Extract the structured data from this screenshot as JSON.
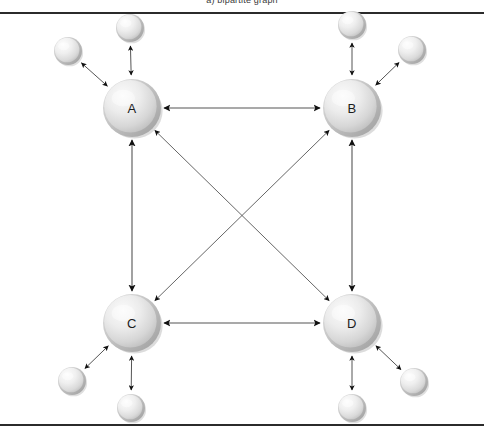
{
  "figure": {
    "width": 484,
    "height": 445,
    "background": "#ffffff",
    "caption_clipped": "a) bipartite graph",
    "frame": {
      "top_rule_y": 12,
      "bottom_rule_y": 424,
      "rule_color": "#2b2b2b",
      "rule_thickness": 2
    }
  },
  "style": {
    "node_fill_light": "#f2f2f2",
    "node_fill_mid": "#d9d9d9",
    "node_fill_dark": "#b4b4b4",
    "node_rim": "#a8a8a8",
    "node_shadow": "#bfbfbf",
    "arrow_color": "#1a1a1a",
    "line_color": "#555555",
    "label_color": "#1c1c1c"
  },
  "main_nodes": [
    {
      "id": "A",
      "label": "A",
      "cx": 132,
      "cy": 108,
      "r": 29
    },
    {
      "id": "B",
      "label": "B",
      "cx": 352,
      "cy": 108,
      "r": 29
    },
    {
      "id": "C",
      "label": "C",
      "cx": 132,
      "cy": 323,
      "r": 29
    },
    {
      "id": "D",
      "label": "D",
      "cx": 352,
      "cy": 323,
      "r": 29
    }
  ],
  "satellite_nodes": [
    {
      "id": "a1",
      "parent": "A",
      "cx": 68,
      "cy": 51,
      "r": 14
    },
    {
      "id": "a2",
      "parent": "A",
      "cx": 130,
      "cy": 28,
      "r": 14
    },
    {
      "id": "b1",
      "parent": "B",
      "cx": 352,
      "cy": 25,
      "r": 14
    },
    {
      "id": "b2",
      "parent": "B",
      "cx": 412,
      "cy": 50,
      "r": 14
    },
    {
      "id": "c1",
      "parent": "C",
      "cx": 72,
      "cy": 381,
      "r": 14
    },
    {
      "id": "c2",
      "parent": "C",
      "cx": 131,
      "cy": 408,
      "r": 14
    },
    {
      "id": "d1",
      "parent": "D",
      "cx": 352,
      "cy": 408,
      "r": 14
    },
    {
      "id": "d2",
      "parent": "D",
      "cx": 414,
      "cy": 382,
      "r": 14
    }
  ],
  "edges": [
    {
      "id": "A-B",
      "from": "A",
      "to": "B",
      "kind": "horizontal",
      "arrow": "double"
    },
    {
      "id": "C-D",
      "from": "C",
      "to": "D",
      "kind": "horizontal",
      "arrow": "double"
    },
    {
      "id": "A-C",
      "from": "A",
      "to": "C",
      "kind": "vertical",
      "arrow": "double"
    },
    {
      "id": "B-D",
      "from": "B",
      "to": "D",
      "kind": "vertical",
      "arrow": "double"
    },
    {
      "id": "A-D",
      "from": "A",
      "to": "D",
      "kind": "diagonal",
      "arrow": "double"
    },
    {
      "id": "B-C",
      "from": "B",
      "to": "C",
      "kind": "diagonal",
      "arrow": "double"
    }
  ],
  "satellite_edges": [
    {
      "id": "A-a1",
      "from": "A",
      "to": "a1",
      "arrow": "double"
    },
    {
      "id": "A-a2",
      "from": "A",
      "to": "a2",
      "arrow": "double"
    },
    {
      "id": "B-b1",
      "from": "B",
      "to": "b1",
      "arrow": "double"
    },
    {
      "id": "B-b2",
      "from": "B",
      "to": "b2",
      "arrow": "double"
    },
    {
      "id": "C-c1",
      "from": "C",
      "to": "c1",
      "arrow": "double"
    },
    {
      "id": "C-c2",
      "from": "C",
      "to": "c2",
      "arrow": "double"
    },
    {
      "id": "D-d1",
      "from": "D",
      "to": "d1",
      "arrow": "double"
    },
    {
      "id": "D-d2",
      "from": "D",
      "to": "d2",
      "arrow": "double"
    }
  ]
}
